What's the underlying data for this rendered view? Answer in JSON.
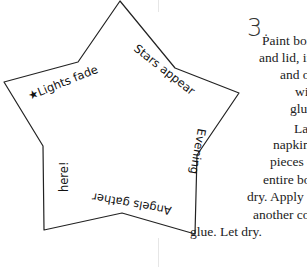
{
  "star_phrases": {
    "p1": "★Lights fade",
    "p2": "Stars appear",
    "p3": "Evening",
    "p4": "Angels gather",
    "p5": "here!"
  },
  "instructions": {
    "step_number": "3.",
    "lines": [
      "Paint box",
      "and lid, inside",
      "and out,",
      "with",
      "glue.",
      "Layer torn",
      "napkin",
      "pieces over",
      "entire box. Let",
      "dry. Apply",
      "another coat of",
      "glue. Let dry."
    ]
  }
}
